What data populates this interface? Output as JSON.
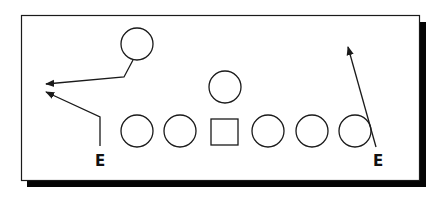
{
  "diagram": {
    "type": "football-play-formation",
    "colors": {
      "ink": "#1a1a1a",
      "shadow": "#050505",
      "background": "#ffffff"
    },
    "players": [
      {
        "id": "back",
        "shape": "circle",
        "role": "offensive back"
      },
      {
        "id": "qb",
        "shape": "circle",
        "role": "offensive back"
      },
      {
        "id": "line-1",
        "shape": "circle",
        "role": "lineman"
      },
      {
        "id": "line-2",
        "shape": "circle",
        "role": "lineman"
      },
      {
        "id": "center",
        "shape": "square",
        "role": "center"
      },
      {
        "id": "line-3",
        "shape": "circle",
        "role": "lineman"
      },
      {
        "id": "line-4",
        "shape": "circle",
        "role": "lineman"
      },
      {
        "id": "line-5",
        "shape": "circle",
        "role": "lineman"
      }
    ],
    "ends": [
      {
        "id": "end-left",
        "label": "E"
      },
      {
        "id": "end-right",
        "label": "E"
      }
    ],
    "routes": [
      {
        "from": "back",
        "description": "angled route toward left sideline"
      },
      {
        "from": "end-left",
        "description": "up then diagonal to left sideline"
      },
      {
        "from": "end-right",
        "description": "straight route upfield to the right"
      }
    ]
  }
}
